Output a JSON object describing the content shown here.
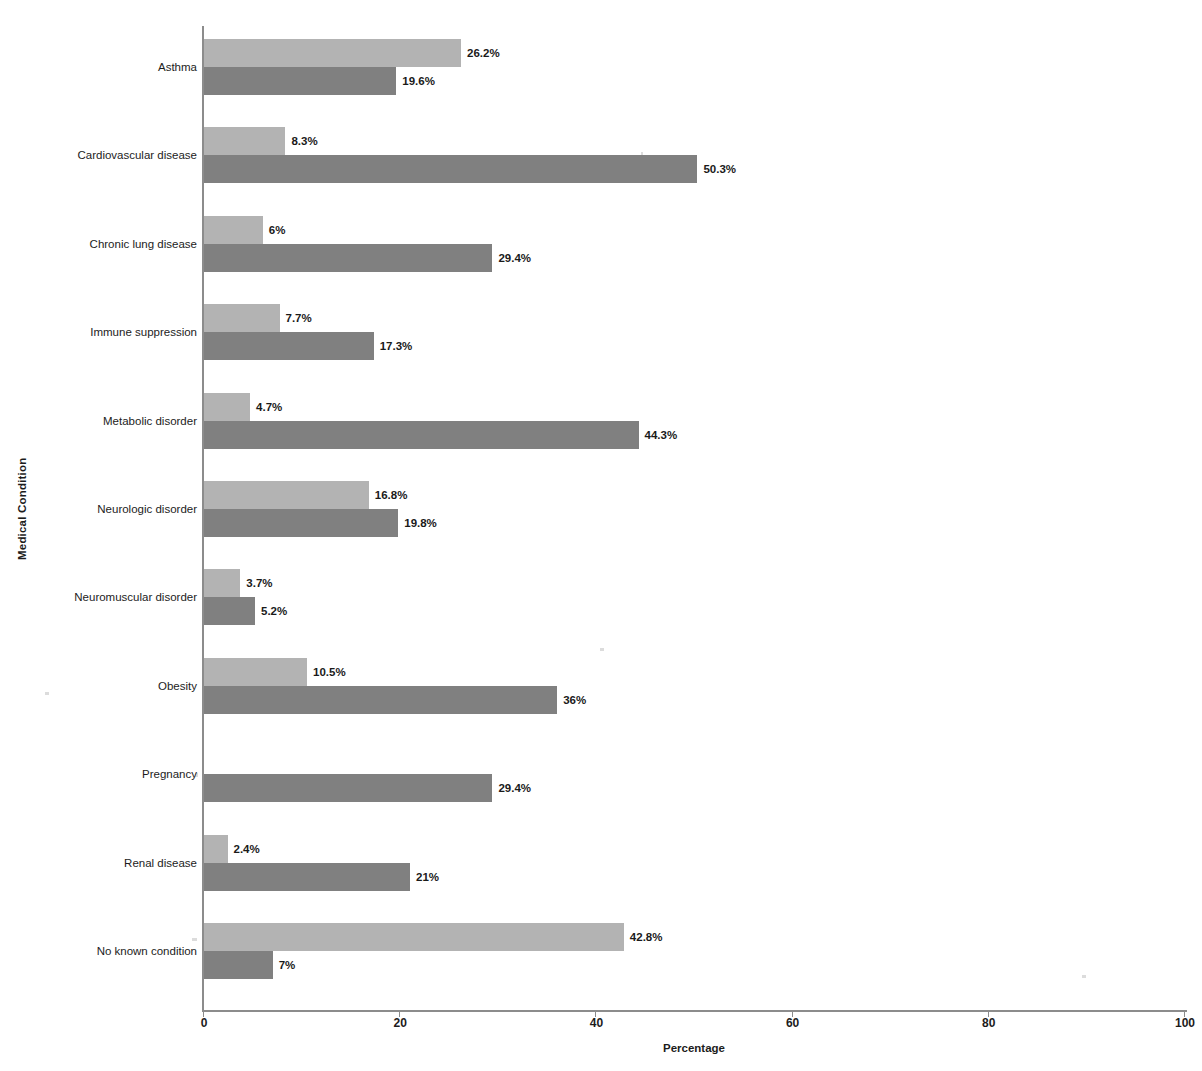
{
  "chart_data": {
    "type": "bar",
    "orientation": "horizontal",
    "title": "",
    "xlabel": "Percentage",
    "ylabel": "Medical Condition",
    "xlim": [
      0,
      100
    ],
    "xticks": [
      0,
      20,
      40,
      60,
      80,
      100
    ],
    "xtick_labels": [
      "0",
      "20",
      "40",
      "60",
      "80",
      "100"
    ],
    "grid": false,
    "legend": null,
    "value_suffix": "%",
    "categories": [
      "Asthma",
      "Cardiovascular disease",
      "Chronic lung disease",
      "Immune suppression",
      "Metabolic disorder",
      "Neurologic disorder",
      "Neuromuscular disorder",
      "Obesity",
      "Pregnancy",
      "Renal disease",
      "No known condition"
    ],
    "series": [
      {
        "name": "series-a",
        "color": "#b3b3b3",
        "values": [
          26.2,
          8.3,
          6,
          7.7,
          4.7,
          16.8,
          3.7,
          10.5,
          0,
          2.4,
          42.8
        ],
        "labels": [
          "26.2%",
          "8.3%",
          "6%",
          "7.7%",
          "4.7%",
          "16.8%",
          "3.7%",
          "10.5%",
          "",
          "2.4%",
          "42.8%"
        ]
      },
      {
        "name": "series-b",
        "color": "#808080",
        "values": [
          19.6,
          50.3,
          29.4,
          17.3,
          44.3,
          19.8,
          5.2,
          36,
          29.4,
          21,
          7
        ],
        "labels": [
          "19.6%",
          "50.3%",
          "29.4%",
          "17.3%",
          "44.3%",
          "19.8%",
          "5.2%",
          "36%",
          "29.4%",
          "21%",
          "7%"
        ]
      }
    ]
  }
}
